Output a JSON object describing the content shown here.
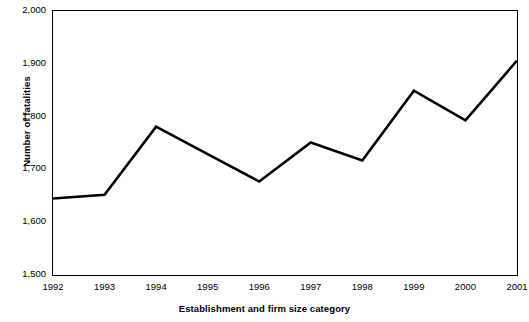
{
  "chart_data": {
    "type": "line",
    "title": "",
    "xlabel": "Establishment and firm size category",
    "ylabel": "Number of fatalities",
    "categories": [
      "1992",
      "1993",
      "1994",
      "1995",
      "1996",
      "1997",
      "1998",
      "1999",
      "2000",
      "2001"
    ],
    "values": [
      1645,
      1652,
      1781,
      1729,
      1677,
      1751,
      1717,
      1849,
      1793,
      1906
    ],
    "series": [
      {
        "name": "Number of fatalities",
        "values": [
          1645,
          1652,
          1781,
          1729,
          1677,
          1751,
          1717,
          1849,
          1793,
          1906
        ]
      }
    ],
    "ylim": [
      1500,
      2000
    ],
    "yticks": [
      1500,
      1600,
      1700,
      1800,
      1900,
      2000
    ],
    "ytick_labels": [
      "1,500",
      "1,600",
      "1,700",
      "1,800",
      "1,900",
      "2,000"
    ],
    "grid": false,
    "legend": "none",
    "line_color": "#000000",
    "background_color": "#ffffff",
    "axis_color": "#000000"
  },
  "axes": {
    "y_title": "Number of fatalities",
    "x_title": "Establishment and firm size category"
  }
}
